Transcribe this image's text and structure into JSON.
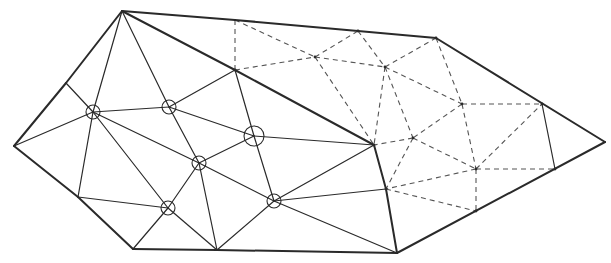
{
  "diagram": {
    "type": "triangulated-mesh",
    "colors": {
      "line": "#2a2a2a",
      "dashed": "#555555",
      "background": "#ffffff"
    },
    "nodes": {
      "A": [
        122,
        11
      ],
      "B": [
        14,
        146
      ],
      "C": [
        133,
        249
      ],
      "D": [
        217,
        250
      ],
      "E": [
        397,
        253
      ],
      "F": [
        605,
        142
      ],
      "G": [
        542,
        104
      ],
      "H": [
        436,
        38
      ],
      "I": [
        358,
        31
      ],
      "J": [
        235,
        20
      ],
      "K": [
        66,
        83
      ],
      "L": [
        78,
        197
      ],
      "M": [
        235,
        70
      ],
      "N": [
        374,
        145
      ],
      "O": [
        386,
        189
      ],
      "P": [
        413,
        138
      ],
      "Q": [
        385,
        67
      ],
      "R": [
        315,
        57
      ],
      "S": [
        462,
        104
      ],
      "T": [
        476,
        169
      ],
      "U": [
        555,
        169
      ],
      "V": [
        476,
        211
      ],
      "c1": [
        93,
        112
      ],
      "c2": [
        169,
        107
      ],
      "c3": [
        254,
        136
      ],
      "c4": [
        199,
        163
      ],
      "c5": [
        168,
        208
      ],
      "c6": [
        274,
        201
      ]
    },
    "circled_nodes": [
      {
        "id": "c1",
        "r": 7
      },
      {
        "id": "c2",
        "r": 7
      },
      {
        "id": "c3",
        "r": 10
      },
      {
        "id": "c4",
        "r": 7
      },
      {
        "id": "c5",
        "r": 7
      },
      {
        "id": "c6",
        "r": 7
      }
    ],
    "boundary_edges": [
      [
        "A",
        "J"
      ],
      [
        "J",
        "I"
      ],
      [
        "I",
        "H"
      ],
      [
        "H",
        "F"
      ],
      [
        "F",
        "E"
      ],
      [
        "E",
        "D"
      ],
      [
        "D",
        "C"
      ],
      [
        "C",
        "L"
      ],
      [
        "L",
        "B"
      ],
      [
        "B",
        "K"
      ],
      [
        "K",
        "A"
      ],
      [
        "A",
        "M"
      ],
      [
        "M",
        "N"
      ],
      [
        "N",
        "O"
      ],
      [
        "O",
        "E"
      ]
    ],
    "solid_edges": [
      [
        "A",
        "c1"
      ],
      [
        "A",
        "c2"
      ],
      [
        "c2",
        "c4"
      ],
      [
        "c4",
        "c6"
      ],
      [
        "c6",
        "E"
      ],
      [
        "K",
        "c1"
      ],
      [
        "B",
        "c1"
      ],
      [
        "c1",
        "L"
      ],
      [
        "c1",
        "c2"
      ],
      [
        "c1",
        "c4"
      ],
      [
        "c1",
        "c5"
      ],
      [
        "L",
        "c5"
      ],
      [
        "c5",
        "C"
      ],
      [
        "c5",
        "D"
      ],
      [
        "c5",
        "c4"
      ],
      [
        "c4",
        "D"
      ],
      [
        "c4",
        "c3"
      ],
      [
        "c2",
        "M"
      ],
      [
        "c2",
        "c3"
      ],
      [
        "M",
        "c3"
      ],
      [
        "c3",
        "N"
      ],
      [
        "c3",
        "c6"
      ],
      [
        "D",
        "c6"
      ],
      [
        "c6",
        "N"
      ],
      [
        "c6",
        "O"
      ],
      [
        "G",
        "U"
      ]
    ],
    "dashed_edges": [
      [
        "J",
        "M"
      ],
      [
        "J",
        "R"
      ],
      [
        "M",
        "R"
      ],
      [
        "R",
        "I"
      ],
      [
        "R",
        "Q"
      ],
      [
        "I",
        "Q"
      ],
      [
        "Q",
        "H"
      ],
      [
        "R",
        "N"
      ],
      [
        "Q",
        "N"
      ],
      [
        "Q",
        "P"
      ],
      [
        "Q",
        "S"
      ],
      [
        "H",
        "S"
      ],
      [
        "S",
        "G"
      ],
      [
        "S",
        "P"
      ],
      [
        "S",
        "T"
      ],
      [
        "P",
        "N"
      ],
      [
        "P",
        "O"
      ],
      [
        "P",
        "T"
      ],
      [
        "T",
        "O"
      ],
      [
        "T",
        "U"
      ],
      [
        "T",
        "G"
      ],
      [
        "T",
        "V"
      ],
      [
        "O",
        "V"
      ]
    ]
  }
}
